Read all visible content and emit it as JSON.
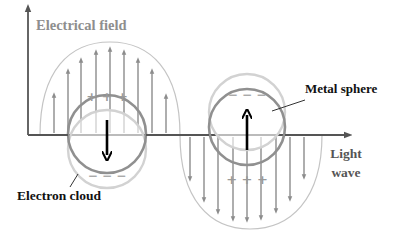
{
  "labels": {
    "electrical_field": "Electrical field",
    "metal_sphere": "Metal sphere",
    "light_wave_line1": "Light",
    "light_wave_line2": "wave",
    "electron_cloud": "Electron cloud"
  },
  "charges": {
    "left_top": "+ + +",
    "left_bottom": "− − −",
    "right_top": "− − −",
    "right_bottom": "+ + +"
  },
  "colors": {
    "axis": "#555555",
    "field_label": "#8a8a8a",
    "field_arrows": "#8c8c8c",
    "lobe_outline": "#b8b8b8",
    "metal_sphere": "#8e8e8e",
    "electron_cloud": "#cfcfcf",
    "dipole_arrow": "#000000",
    "text_dark": "#111111",
    "text_gray": "#555555"
  },
  "field": {
    "up_arrows": [
      {
        "x": 54,
        "top": 92
      },
      {
        "x": 68,
        "top": 68
      },
      {
        "x": 81,
        "top": 57
      },
      {
        "x": 96,
        "top": 49
      },
      {
        "x": 110,
        "top": 46
      },
      {
        "x": 124,
        "top": 49
      },
      {
        "x": 138,
        "top": 57
      },
      {
        "x": 152,
        "top": 68
      },
      {
        "x": 166,
        "top": 93
      }
    ],
    "down_arrows": [
      {
        "x": 190,
        "bottom": 182
      },
      {
        "x": 204,
        "bottom": 203
      },
      {
        "x": 218,
        "bottom": 215
      },
      {
        "x": 233,
        "bottom": 222
      },
      {
        "x": 247,
        "bottom": 223
      },
      {
        "x": 261,
        "bottom": 221
      },
      {
        "x": 276,
        "bottom": 214
      },
      {
        "x": 290,
        "bottom": 202
      },
      {
        "x": 304,
        "bottom": 180
      }
    ]
  }
}
